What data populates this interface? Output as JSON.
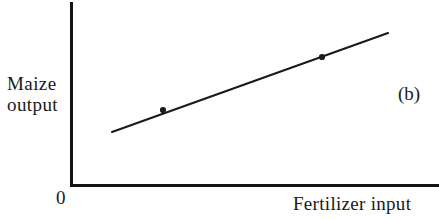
{
  "figure": {
    "panel_label": "(b)",
    "origin_label": "0",
    "ylabel_line1": "Maize",
    "ylabel_line2": "output",
    "xlabel": "Fertilizer input",
    "ink_color": "#1a1a1a",
    "background_color": "#ffffff"
  },
  "chart_data": {
    "type": "line",
    "title": "",
    "subtitle": "",
    "panel": "(b)",
    "xlabel": "Fertilizer input",
    "ylabel": "Maize output",
    "xlabel_ticks": [],
    "ylabel_ticks": [],
    "origin_tick": "0",
    "grid": false,
    "legend": null,
    "axis_style": "open L-shaped axes, no tick marks, no numeric scale",
    "xlim": [
      0,
      1
    ],
    "ylim": [
      0,
      1
    ],
    "series": [
      {
        "name": "maize response to fertilizer",
        "marker": "filled-circle",
        "line_style": "solid",
        "x": [
          0.11,
          0.25,
          0.68,
          1.0
        ],
        "y": [
          0.29,
          0.41,
          0.7,
          0.83
        ],
        "marker_at": [
          false,
          true,
          true,
          false
        ],
        "points_px": [
          {
            "x": 112,
            "y": 132
          },
          {
            "x": 163,
            "y": 110
          },
          {
            "x": 322,
            "y": 57
          },
          {
            "x": 388,
            "y": 33
          }
        ]
      }
    ],
    "annotations": [
      {
        "text": "(b)",
        "x_px": 400,
        "y_px": 95,
        "role": "panel-identifier"
      }
    ]
  }
}
